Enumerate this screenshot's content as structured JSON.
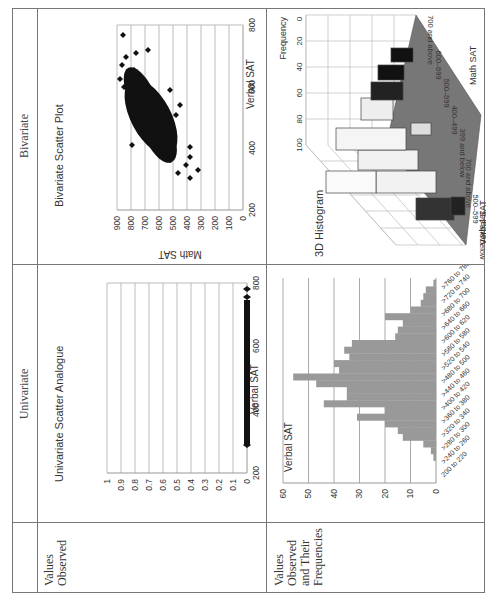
{
  "table": {
    "column_headers": [
      "",
      "Univariate",
      "Bivariate"
    ],
    "row_headers": [
      "Values Observed",
      "Values Observed and Their Frequencies"
    ],
    "row_header_lines": {
      "values_observed": [
        "Values",
        "Observed"
      ],
      "values_freq": [
        "Values",
        "Observed",
        "and Their",
        "Frequencies"
      ]
    }
  },
  "caption": "Figure ... Univariate and bivariate displays of the SAT data",
  "charts": {
    "univariate_scatter": {
      "title": "Univariate Scatter Analogue",
      "xlabel": "Verbal SAT",
      "x_ticks": [
        "200",
        "400",
        "600",
        "800"
      ],
      "y_ticks": [
        "0",
        "0.1",
        "0.2",
        "0.3",
        "0.4",
        "0.5",
        "0.6",
        "0.7",
        "0.8",
        "0.9",
        "1"
      ]
    },
    "bivariate_scatter": {
      "title": "Bivariate Scatter Plot",
      "xlabel": "Verbal SAT",
      "ylabel": "Math SAT",
      "x_ticks": [
        "200",
        "400",
        "600",
        "800"
      ],
      "y_ticks": [
        "0",
        "100",
        "200",
        "300",
        "400",
        "500",
        "600",
        "700",
        "800",
        "900"
      ]
    },
    "histogram": {
      "title": "Verbal SAT",
      "y_ticks": [
        "0",
        "10",
        "20",
        "30",
        "40",
        "50",
        "60"
      ],
      "x_ticks": [
        "200 to 220",
        ">240 to 260",
        ">280 to 300",
        ">320 to 340",
        ">360 to 380",
        ">400 to 420",
        ">440 to 460",
        ">480 to 500",
        ">520 to 540",
        ">560 to 580",
        ">600 to 620",
        ">640 to 660",
        ">680 to 700",
        ">720 to 740",
        ">760 to 780"
      ]
    },
    "histogram_3d": {
      "title": "3D Histogram",
      "z_label": "Frequency",
      "z_ticks": [
        "0",
        "20",
        "40",
        "60",
        "80",
        "100"
      ],
      "math_label": "Math SAT",
      "verbal_label": "Verbal SAT",
      "math_cats": [
        "399 and below",
        "400-499",
        "500-599",
        "600-699",
        "700 and above"
      ],
      "verbal_cats": [
        "399 and below",
        "500-599",
        "700 and above"
      ]
    }
  },
  "chart_data": [
    {
      "type": "scatter",
      "title": "Univariate Scatter Analogue",
      "xlabel": "Verbal SAT",
      "ylabel": "",
      "xlim": [
        200,
        800
      ],
      "ylim": [
        0,
        1
      ],
      "note": "All points at y=0, spanning roughly Verbal SAT 290 to 780",
      "x_range_observed": [
        290,
        780
      ],
      "y_constant": 0
    },
    {
      "type": "scatter",
      "title": "Bivariate Scatter Plot",
      "xlabel": "Verbal SAT",
      "ylabel": "Math SAT",
      "xlim": [
        200,
        800
      ],
      "ylim": [
        0,
        900
      ],
      "note": "Dense cloud, positive correlation; Verbal ~290-780, Math ~300-780",
      "x_range_observed": [
        290,
        780
      ],
      "y_range_observed": [
        300,
        780
      ]
    },
    {
      "type": "bar",
      "orientation": "vertical",
      "title": "Verbal SAT",
      "xlabel": "",
      "ylabel": "",
      "ylim": [
        0,
        60
      ],
      "categories": [
        "200-220",
        "220-240",
        "240-260",
        "260-280",
        "280-300",
        "300-320",
        "320-340",
        "340-360",
        "360-380",
        "380-400",
        "400-420",
        "420-440",
        "440-460",
        "460-480",
        "480-500",
        "500-520",
        "520-540",
        "540-560",
        "560-580",
        "580-600",
        "600-620",
        "620-640",
        "640-660",
        "660-680",
        "680-700",
        "700-720",
        "720-740",
        "740-760",
        "760-780"
      ],
      "values": [
        0,
        0,
        0,
        1,
        2,
        5,
        13,
        15,
        20,
        31,
        20,
        44,
        35,
        35,
        47,
        56,
        38,
        40,
        34,
        36,
        33,
        16,
        15,
        13,
        20,
        10,
        6,
        5,
        4,
        1
      ]
    },
    {
      "type": "bar3d",
      "title": "3D Histogram",
      "xlabel": "Math SAT",
      "ylabel": "Verbal SAT",
      "zlabel": "Frequency",
      "zlim": [
        0,
        100
      ],
      "math_categories": [
        "399 and below",
        "400-499",
        "500-599",
        "600-699",
        "700 and above"
      ],
      "verbal_categories": [
        "399 and below",
        "400-499",
        "500-599",
        "600-699",
        "700 and above"
      ],
      "values_approx": [
        [
          2,
          5,
          8,
          4,
          1
        ],
        [
          8,
          30,
          55,
          25,
          6
        ],
        [
          10,
          50,
          95,
          45,
          10
        ],
        [
          4,
          20,
          85,
          40,
          12
        ],
        [
          1,
          3,
          10,
          20,
          15
        ]
      ]
    }
  ]
}
